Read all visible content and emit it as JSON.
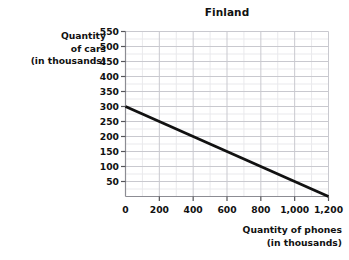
{
  "chart_data": {
    "type": "line",
    "title": "Finland",
    "xlabel": "Quantity of phones (in thousands)",
    "xlabel_lines": [
      "Quantity of phones",
      "(in thousands)"
    ],
    "ylabel": "Quantity of cars (in thousands)",
    "ylabel_lines": [
      "Quantity",
      "of cars",
      "(in thousands)"
    ],
    "xlim": [
      0,
      1200
    ],
    "ylim": [
      0,
      550
    ],
    "grid": true,
    "legend": "none",
    "x_tick_labels": [
      "0",
      "200",
      "400",
      "600",
      "800",
      "1,000",
      "1,200"
    ],
    "x_tick_values": [
      0,
      200,
      400,
      600,
      800,
      1000,
      1200
    ],
    "x_minor_step": 100,
    "y_tick_labels": [
      "50",
      "100",
      "150",
      "200",
      "250",
      "300",
      "350",
      "400",
      "450",
      "500",
      "550"
    ],
    "y_tick_values": [
      50,
      100,
      150,
      200,
      250,
      300,
      350,
      400,
      450,
      500,
      550
    ],
    "y_minor_step": 25,
    "series": [
      {
        "name": "production possibilities frontier",
        "color": "#111111",
        "x": [
          0,
          1200
        ],
        "values": [
          300,
          0
        ],
        "points": [
          [
            0,
            300
          ],
          [
            200,
            250
          ],
          [
            400,
            200
          ],
          [
            600,
            150
          ],
          [
            800,
            100
          ],
          [
            1000,
            50
          ],
          [
            1200,
            0
          ]
        ]
      }
    ]
  }
}
